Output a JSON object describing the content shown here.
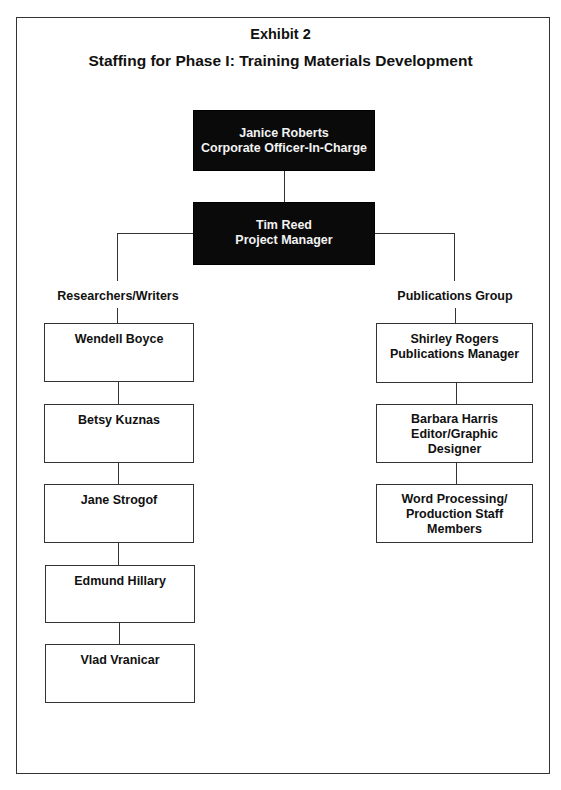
{
  "header": {
    "exhibit": "Exhibit 2",
    "title": "Staffing for Phase I: Training Materials Development"
  },
  "top": [
    {
      "name": "Janice Roberts",
      "role": "Corporate Officer-In-Charge"
    },
    {
      "name": "Tim Reed",
      "role": "Project Manager"
    }
  ],
  "left_group": {
    "label": "Researchers/Writers",
    "members": [
      {
        "name": "Wendell Boyce"
      },
      {
        "name": "Betsy Kuznas"
      },
      {
        "name": "Jane Strogof"
      },
      {
        "name": "Edmund Hillary"
      },
      {
        "name": "Vlad Vranicar"
      }
    ]
  },
  "right_group": {
    "label": "Publications Group",
    "members": [
      {
        "lines": [
          "Shirley Rogers",
          "Publications Manager"
        ]
      },
      {
        "lines": [
          "Barbara Harris",
          "Editor/Graphic",
          "Designer"
        ]
      },
      {
        "lines": [
          "Word Processing/",
          "Production Staff",
          "Members"
        ]
      }
    ]
  }
}
